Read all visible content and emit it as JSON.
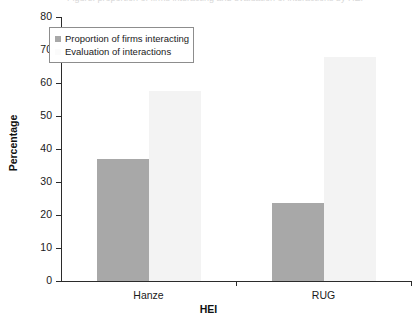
{
  "figure": {
    "clipped_title": "Figure: proportion of firms interacting and evaluation of interactions by HEI"
  },
  "chart_data": {
    "type": "bar",
    "title": "",
    "xlabel": "HEI",
    "ylabel": "Percentage",
    "categories": [
      "Hanze",
      "RUG"
    ],
    "series": [
      {
        "name": "Proportion of firms interacting",
        "values": [
          37,
          23.5
        ],
        "color": "#a8a8a8"
      },
      {
        "name": "Evaluation of interactions",
        "values": [
          57.5,
          68
        ],
        "color": "#f3f3f3"
      }
    ],
    "ylim": [
      0,
      80
    ],
    "ytick_labels": [
      "0",
      "10",
      "20",
      "30",
      "40",
      "50",
      "60",
      "70",
      "80"
    ],
    "ytick_values": [
      0,
      10,
      20,
      30,
      40,
      50,
      60,
      70,
      80
    ],
    "grid": false,
    "legend_position": "upper-left"
  }
}
